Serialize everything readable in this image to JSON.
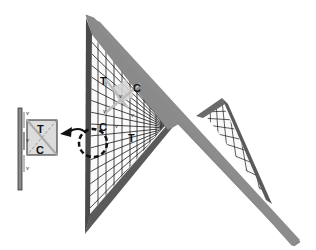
{
  "diagram": {
    "type": "structural-illustration",
    "colors": {
      "frame": "#8a8a8a",
      "frame_dark": "#555555",
      "grid": "#1a1a1a",
      "element_fill": "#d8d8d8",
      "background": "#ffffff"
    },
    "main_labels": {
      "tension_top": "T",
      "compression_right": "C",
      "compression_left": "C",
      "tension_bottom": "T",
      "shear_1": "v",
      "shear_2": "v",
      "shear_3": "v",
      "shear_4": "v"
    },
    "inset": {
      "tension": "T",
      "compression": "C",
      "shear_top": "v",
      "shear_mid": "v",
      "shear_bottom": "v"
    },
    "callout": {
      "style": "dashed-circle",
      "arrow": "curved-arrow-left"
    }
  }
}
